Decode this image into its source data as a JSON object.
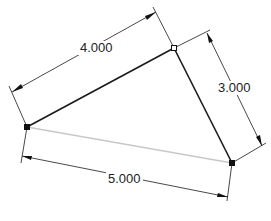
{
  "sketch": {
    "colors": {
      "background": "#ffffff",
      "edge_solid": "#1a1a1a",
      "edge_construction": "#c8c8c8",
      "dimension": "#333333",
      "vertex": "#111111"
    },
    "vertices": [
      {
        "id": "A",
        "x": 27,
        "y": 127,
        "style": "filled"
      },
      {
        "id": "B",
        "x": 174,
        "y": 48,
        "style": "hollow"
      },
      {
        "id": "C",
        "x": 232,
        "y": 163,
        "style": "filled"
      }
    ],
    "edges": [
      {
        "from": "A",
        "to": "B",
        "style": "solid"
      },
      {
        "from": "B",
        "to": "C",
        "style": "solid"
      },
      {
        "from": "A",
        "to": "C",
        "style": "construction"
      }
    ],
    "dimensions": [
      {
        "id": "dim-ab",
        "label": "4.000",
        "text_x": 64,
        "text_y": 40
      },
      {
        "id": "dim-bc",
        "label": "3.000",
        "text_x": 216,
        "text_y": 81
      },
      {
        "id": "dim-ac",
        "label": "5.000",
        "text_x": 104,
        "text_y": 171
      }
    ]
  }
}
